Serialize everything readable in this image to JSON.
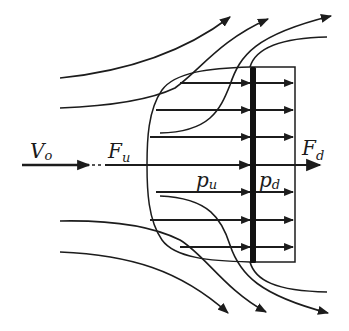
{
  "diagram": {
    "labels": {
      "freestream_velocity": "V",
      "freestream_velocity_sub": "o",
      "upstream_force": "F",
      "upstream_force_sub": "u",
      "downstream_force": "F",
      "downstream_force_sub": "d",
      "upstream_pressure": "p",
      "upstream_pressure_sub": "u",
      "downstream_pressure": "p",
      "downstream_pressure_sub": "d"
    },
    "colors": {
      "ink": "#1c1c1c",
      "background": "#ffffff"
    },
    "elements": {
      "actuator_disc": "thick vertical bar",
      "control_volume": "curved boundary enclosing the disc",
      "velocity_arrows_rows": 7,
      "streamlines_above": 4,
      "streamlines_below": 4
    }
  }
}
